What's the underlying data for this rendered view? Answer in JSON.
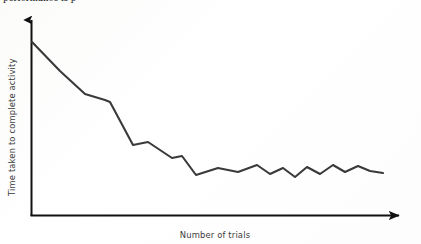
{
  "figure": {
    "clipped_top_caption": "performance is p",
    "background_color": "#fdfdfd",
    "line_color": "#3a3a3a",
    "axis_color": "#111111",
    "label_color": "#3b3b3b"
  },
  "chart_data": {
    "type": "line",
    "title": "",
    "subtitle": "",
    "xlabel": "Number of trials",
    "ylabel": "Time taken to complete activity",
    "grid": false,
    "legend": null,
    "axis_arrows": {
      "y_axis": "arrow-up",
      "x_axis": "arrow-right"
    },
    "xlim": [
      0,
      24
    ],
    "ylim": [
      0,
      10
    ],
    "x_tick_labels": [],
    "y_tick_labels": [],
    "annotations": [],
    "series": [
      {
        "name": "Time taken to complete activity",
        "x": [
          0,
          1,
          2,
          3,
          4,
          5,
          6,
          7,
          8,
          9,
          10,
          11,
          12,
          13,
          14,
          15,
          16,
          17,
          18,
          19,
          20,
          21,
          22,
          23
        ],
        "y": [
          9.6,
          8.4,
          7.1,
          6.7,
          6.5,
          5.0,
          4.1,
          4.3,
          3.3,
          3.5,
          3.4,
          2.4,
          2.8,
          2.5,
          2.7,
          2.9,
          2.4,
          2.6,
          2.3,
          2.5,
          2.4,
          2.6,
          2.3,
          2.4
        ]
      }
    ],
    "points_px": [
      [
        32,
        42
      ],
      [
        60,
        71
      ],
      [
        85,
        94
      ],
      [
        105,
        100
      ],
      [
        110,
        102
      ],
      [
        133,
        145
      ],
      [
        148,
        142
      ],
      [
        172,
        158
      ],
      [
        182,
        156
      ],
      [
        196,
        175
      ],
      [
        218,
        168
      ],
      [
        238,
        172
      ],
      [
        257,
        165
      ],
      [
        270,
        174
      ],
      [
        283,
        168
      ],
      [
        295,
        177
      ],
      [
        307,
        167
      ],
      [
        320,
        174
      ],
      [
        333,
        165
      ],
      [
        345,
        172
      ],
      [
        358,
        166
      ],
      [
        370,
        171
      ],
      [
        383,
        173
      ]
    ],
    "plot_box_px": {
      "x0": 31,
      "y0": 20,
      "x1": 400,
      "y1": 216
    }
  }
}
